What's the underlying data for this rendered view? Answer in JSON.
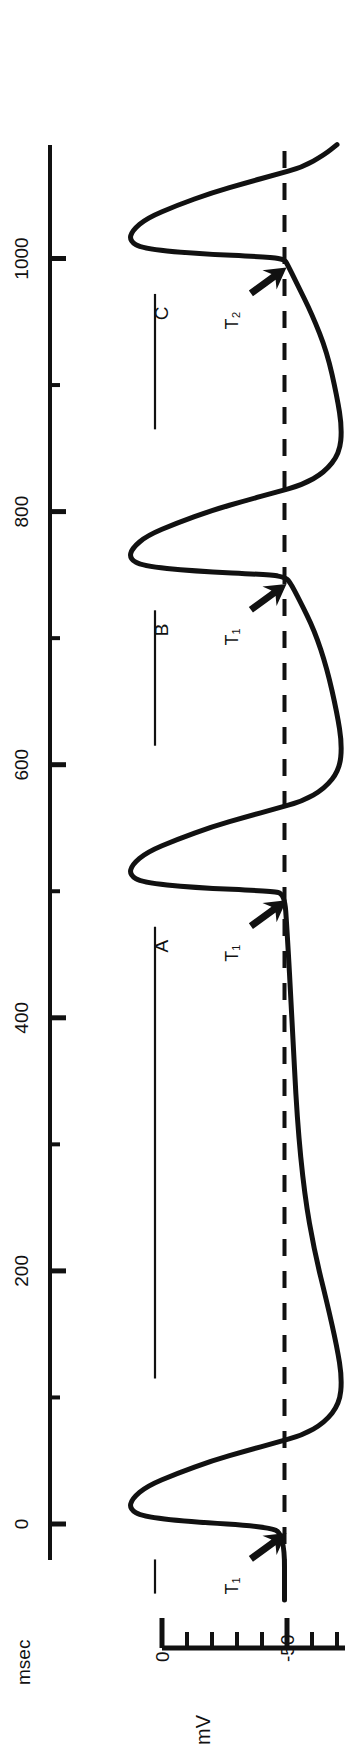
{
  "figure": {
    "kind": "electrophysiology-recording",
    "orientation": "rotated-90-counterclockwise",
    "background_color": "#ffffff",
    "trace_color": "#111111",
    "axis_color": "#111111",
    "dashed_line_color": "#111111"
  },
  "time_axis": {
    "unit_label": "msec",
    "tick_labels": [
      "0",
      "200",
      "400",
      "600",
      "800",
      "1000"
    ],
    "labeled_ticks": [
      0,
      200,
      400,
      600,
      800,
      1000
    ],
    "minor_tick_interval": 100,
    "range": [
      -60,
      1090
    ]
  },
  "voltage_axis": {
    "unit_label": "mV",
    "tick_labels": [
      "0",
      "-50"
    ],
    "labeled_ticks": [
      0,
      -50
    ],
    "minor_tick_interval": 10,
    "range": [
      20,
      -80
    ]
  },
  "annotations": {
    "trace_labels": [
      "A",
      "B",
      "C"
    ],
    "threshold_markers": [
      "T₁",
      "T₁",
      "T₁",
      "T₂"
    ],
    "threshold_voltage_mV": -49
  },
  "chart_data": {
    "type": "line",
    "title": "",
    "xlabel": "msec",
    "ylabel": "mV",
    "xlim": [
      -60,
      1090
    ],
    "ylim": [
      -80,
      20
    ],
    "grid": false,
    "legend": null,
    "rotation_deg": -90,
    "dashed_threshold_mV": -49,
    "resting_potential_mV": -49,
    "overshoot_peak_mV": 14,
    "afterhyperpolarization_mV": -72,
    "action_potential_times_msec": [
      0,
      500,
      750,
      1000
    ],
    "action_potential_labels": [
      "",
      "A",
      "B",
      "C"
    ],
    "threshold_arrow_labels": [
      "T₁",
      "T₁",
      "T₁",
      "T₂"
    ],
    "series": [
      {
        "name": "membrane potential",
        "points_msec_mV": [
          [
            -60,
            -49
          ],
          [
            -8,
            -49
          ],
          [
            -2,
            -42
          ],
          [
            2,
            -10
          ],
          [
            6,
            8
          ],
          [
            12,
            13
          ],
          [
            20,
            12
          ],
          [
            30,
            6
          ],
          [
            40,
            -6
          ],
          [
            50,
            -20
          ],
          [
            58,
            -34
          ],
          [
            64,
            -45
          ],
          [
            70,
            -56
          ],
          [
            80,
            -65
          ],
          [
            95,
            -71
          ],
          [
            115,
            -72
          ],
          [
            140,
            -70
          ],
          [
            175,
            -66
          ],
          [
            215,
            -61
          ],
          [
            260,
            -57
          ],
          [
            320,
            -54
          ],
          [
            400,
            -52
          ],
          [
            470,
            -50
          ],
          [
            498,
            -49
          ],
          [
            500,
            -44
          ],
          [
            503,
            -12
          ],
          [
            507,
            8
          ],
          [
            513,
            13
          ],
          [
            521,
            12
          ],
          [
            531,
            6
          ],
          [
            541,
            -6
          ],
          [
            551,
            -20
          ],
          [
            559,
            -34
          ],
          [
            565,
            -45
          ],
          [
            571,
            -56
          ],
          [
            581,
            -65
          ],
          [
            596,
            -71
          ],
          [
            616,
            -72
          ],
          [
            641,
            -70
          ],
          [
            676,
            -66
          ],
          [
            706,
            -61
          ],
          [
            730,
            -55
          ],
          [
            745,
            -51
          ],
          [
            748,
            -49
          ],
          [
            750,
            -44
          ],
          [
            753,
            -12
          ],
          [
            757,
            8
          ],
          [
            763,
            13
          ],
          [
            771,
            12
          ],
          [
            781,
            6
          ],
          [
            791,
            -6
          ],
          [
            801,
            -20
          ],
          [
            809,
            -34
          ],
          [
            815,
            -45
          ],
          [
            821,
            -56
          ],
          [
            831,
            -65
          ],
          [
            846,
            -71
          ],
          [
            866,
            -72
          ],
          [
            891,
            -70
          ],
          [
            926,
            -66
          ],
          [
            956,
            -60
          ],
          [
            980,
            -54
          ],
          [
            996,
            -50
          ],
          [
            999,
            -49
          ],
          [
            1001,
            -44
          ],
          [
            1004,
            -12
          ],
          [
            1008,
            8
          ],
          [
            1014,
            13
          ],
          [
            1022,
            12
          ],
          [
            1032,
            6
          ],
          [
            1042,
            -6
          ],
          [
            1052,
            -20
          ],
          [
            1060,
            -34
          ],
          [
            1066,
            -45
          ],
          [
            1072,
            -56
          ],
          [
            1082,
            -65
          ],
          [
            1090,
            -70
          ]
        ]
      }
    ]
  }
}
